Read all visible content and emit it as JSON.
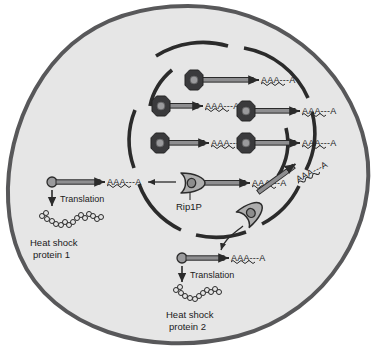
{
  "figure": {
    "background_color": "#ffffff",
    "cell": {
      "name": "cell",
      "fill": "#e6e6e6",
      "stroke": "#58585a",
      "stroke_width": 4
    },
    "nucleus": {
      "name": "nucleus",
      "stroke": "#2b2b2b",
      "stroke_width": 3.6,
      "style": "broken-arcs"
    }
  },
  "colors": {
    "polymerase_fill": "#3a3a3c",
    "polymerase_core": "#9a9a9c",
    "enzyme_fill": "#adadad",
    "enzyme_stroke": "#2b2b2b",
    "mrna_body": "#8e8e90",
    "mrna_stroke": "#2b2b2b",
    "text": "#1a1a1a",
    "arrow": "#2b2b2b",
    "protein_bead_stroke": "#2b2b2b"
  },
  "nucleus_transcripts": [
    {
      "id": "transcript-1",
      "polya_label": "AAA---A"
    },
    {
      "id": "transcript-2",
      "polya_label": "AAA---A"
    },
    {
      "id": "transcript-3",
      "polya_label": "AAA---A"
    },
    {
      "id": "transcript-4",
      "polya_label": "AAA---A"
    },
    {
      "id": "transcript-5",
      "polya_label": "AAA---A"
    },
    {
      "id": "transcript-6",
      "polya_label": "AAA---A"
    }
  ],
  "enzyme": {
    "label": "Rip1P",
    "instances": 2
  },
  "pathway_left": {
    "mrna_polya_label": "AAA---A",
    "translation_label": "Translation",
    "product_line1": "Heat shock",
    "product_line2": "protein 1"
  },
  "pathway_bottom": {
    "mrna_polya_label": "AAA---A",
    "cleaved_polya_label": "AAA---A",
    "translation_label": "Translation",
    "product_line1": "Heat shock",
    "product_line2": "protein 2"
  }
}
